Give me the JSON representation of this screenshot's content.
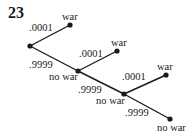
{
  "problem_number": "23",
  "tree": {
    "branches": [
      {
        "prob": ".0001",
        "outcome": "war"
      },
      {
        "prob": ".9999",
        "outcome": "no war"
      },
      {
        "prob": ".0001",
        "outcome": "war"
      },
      {
        "prob": ".9999",
        "outcome": "no war"
      },
      {
        "prob": ".0001",
        "outcome": "war"
      },
      {
        "prob": ".9999",
        "outcome": "no war"
      }
    ]
  }
}
